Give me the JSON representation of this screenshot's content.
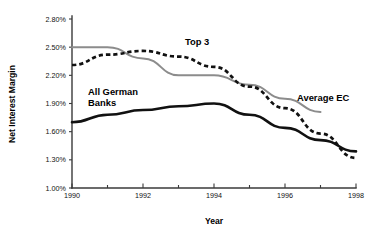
{
  "chart_data": {
    "type": "line",
    "title": "",
    "xlabel": "Year",
    "ylabel": "Net Interest Margin",
    "xlim": [
      1990,
      1998
    ],
    "ylim": [
      1.0,
      2.8
    ],
    "grid": false,
    "legend_position": "inline-annotations",
    "x": [
      1990,
      1991,
      1992,
      1993,
      1994,
      1995,
      1996,
      1997,
      1998
    ],
    "y_tick_labels": [
      "1.00%",
      "1.30%",
      "1.60%",
      "1.90%",
      "2.20%",
      "2.50%",
      "2.80%"
    ],
    "y_tick_values": [
      1.0,
      1.3,
      1.6,
      1.9,
      2.2,
      2.5,
      2.8
    ],
    "x_tick_values": [
      1990,
      1991,
      1992,
      1993,
      1994,
      1995,
      1996,
      1997,
      1998
    ],
    "x_tick_labels": [
      "1990",
      "",
      "1992",
      "",
      "1994",
      "",
      "1996",
      "",
      "1998"
    ],
    "series": [
      {
        "name": "Average EC",
        "style": "solid",
        "color": "#8c8c8c",
        "x": [
          1990,
          1991,
          1992,
          1993,
          1994,
          1995,
          1996,
          1997
        ],
        "values": [
          2.5,
          2.5,
          2.38,
          2.2,
          2.2,
          2.1,
          1.95,
          1.81
        ]
      },
      {
        "name": "Top 3",
        "style": "dashed",
        "color": "#111111",
        "x": [
          1990,
          1991,
          1992,
          1993,
          1994,
          1995,
          1996,
          1997,
          1998
        ],
        "values": [
          2.31,
          2.42,
          2.46,
          2.4,
          2.29,
          2.08,
          1.85,
          1.58,
          1.32
        ]
      },
      {
        "name": "All German Banks",
        "style": "solid",
        "color": "#111111",
        "x": [
          1990,
          1991,
          1992,
          1993,
          1994,
          1995,
          1996,
          1997,
          1998
        ],
        "values": [
          1.7,
          1.78,
          1.83,
          1.87,
          1.9,
          1.78,
          1.64,
          1.51,
          1.39
        ]
      }
    ],
    "annotations": [
      {
        "text": "Top 3",
        "x_px": 185,
        "y_px": 45
      },
      {
        "text": "Average EC",
        "x_px": 297,
        "y_px": 101
      },
      {
        "text": "All German",
        "x_px": 88,
        "y_px": 95
      },
      {
        "text": "Banks",
        "x_px": 88,
        "y_px": 106
      }
    ]
  }
}
